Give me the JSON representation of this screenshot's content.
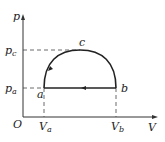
{
  "diagram": {
    "type": "pV-cycle",
    "axes": {
      "y_label": "p",
      "x_label": "V",
      "origin_label": "O"
    },
    "ticks": {
      "pc": {
        "main": "p",
        "sub": "c"
      },
      "pa": {
        "main": "p",
        "sub": "a"
      },
      "Va": {
        "main": "V",
        "sub": "a"
      },
      "Vb": {
        "main": "V",
        "sub": "b"
      }
    },
    "points": {
      "a": "a",
      "b": "b",
      "c": "c"
    },
    "process": "semicircle a→c→b, straight line b→a"
  }
}
